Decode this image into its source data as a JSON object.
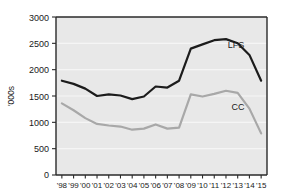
{
  "chart_data": {
    "type": "line",
    "title": "",
    "xlabel": "",
    "ylabel": "'000s",
    "ylim": [
      0,
      3000
    ],
    "yticks": [
      0,
      500,
      1000,
      1500,
      2000,
      2500,
      3000
    ],
    "ytick_labels": [
      "0",
      "500",
      "1000",
      "1500",
      "2000",
      "2500",
      "3000"
    ],
    "grid": true,
    "grid_axis": "y",
    "legend_position": "inline-right",
    "x": [
      "'98",
      "'99",
      "'00",
      "'01",
      "'02",
      "'03",
      "'04",
      "'05",
      "'06",
      "'07",
      "'08",
      "'09",
      "'10",
      "'11",
      "'12",
      "'13",
      "'14",
      "'15"
    ],
    "categories": [
      "'98",
      "'99",
      "'00",
      "'01",
      "'02",
      "'03",
      "'04",
      "'05",
      "'06",
      "'07",
      "'08",
      "'09",
      "'10",
      "'11",
      "'12",
      "'13",
      "'14",
      "'15"
    ],
    "series": [
      {
        "name": "LFS",
        "color": "#1c1c1c",
        "width": 2.2,
        "label_x": "'13",
        "values": [
          1790,
          1730,
          1640,
          1500,
          1530,
          1510,
          1440,
          1490,
          1680,
          1660,
          1790,
          2400,
          2480,
          2560,
          2580,
          2500,
          2280,
          1790
        ]
      },
      {
        "name": "CC",
        "color": "#a8a8a8",
        "width": 2.2,
        "label_x": "'13",
        "values": [
          1360,
          1230,
          1080,
          970,
          940,
          920,
          860,
          880,
          960,
          880,
          900,
          1530,
          1490,
          1540,
          1600,
          1560,
          1260,
          790
        ]
      }
    ]
  },
  "axes": {
    "y_axis_title": "'000s",
    "y_tick_labels": [
      "3000",
      "2500",
      "2000",
      "1500",
      "1000",
      "500",
      "0"
    ],
    "x_tick_labels": [
      "'98",
      "'99",
      "'00",
      "'01",
      "'02",
      "'03",
      "'04",
      "'05",
      "'06",
      "'07",
      "'08",
      "'09",
      "'10",
      "'11",
      "'12",
      "'13",
      "'14",
      "'15"
    ]
  },
  "annotations": {
    "lfs_label": "LFS",
    "cc_label": "CC"
  },
  "colors": {
    "plot_background": "#e8e8e8",
    "figure_background": "#ffffff",
    "gridline": "#f4f4f4",
    "frame": "#2a2a2a",
    "lfs_line": "#1c1c1c",
    "cc_line": "#a8a8a8",
    "text": "#1a1a1a"
  }
}
